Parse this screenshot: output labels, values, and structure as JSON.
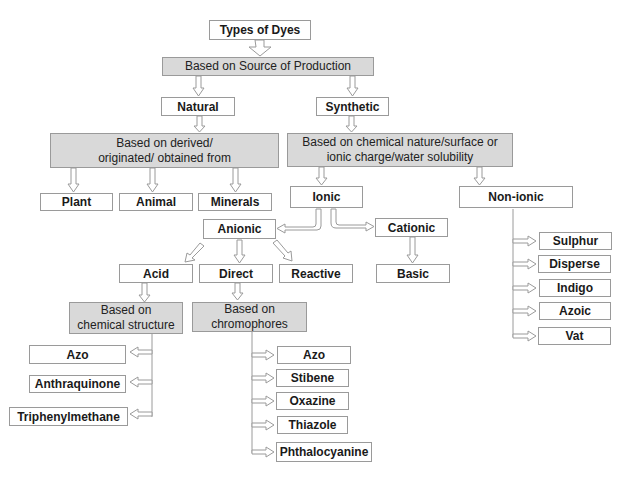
{
  "diagram": {
    "title": "Types of Dyes",
    "nodes": {
      "root": "Types of Dyes",
      "source": "Based on Source of Production",
      "natural": "Natural",
      "synthetic": "Synthetic",
      "derived": "Based on derived/ originated/ obtained from",
      "chemical": "Based on chemical nature/surface or ionic charge/water solubility",
      "plant": "Plant",
      "animal": "Animal",
      "minerals": "Minerals",
      "ionic": "Ionic",
      "nonionic": "Non-ionic",
      "anionic": "Anionic",
      "cationic": "Cationic",
      "acid": "Acid",
      "direct": "Direct",
      "reactive": "Reactive",
      "basic": "Basic",
      "chem_structure": "Based on chemical structure",
      "chromophores": "Based on chromophores",
      "structure_items": [
        "Azo",
        "Anthraquinone",
        "Triphenylmethane"
      ],
      "chromophore_items": [
        "Azo",
        "Stibene",
        "Oxazine",
        "Thiazole",
        "Phthalocyanine"
      ],
      "nonionic_items": [
        "Sulphur",
        "Disperse",
        "Indigo",
        "Azoic",
        "Vat"
      ]
    },
    "colors": {
      "category_fill": "#d9d9d9",
      "leaf_fill": "#ffffff",
      "border": "#9a9a9a"
    }
  }
}
